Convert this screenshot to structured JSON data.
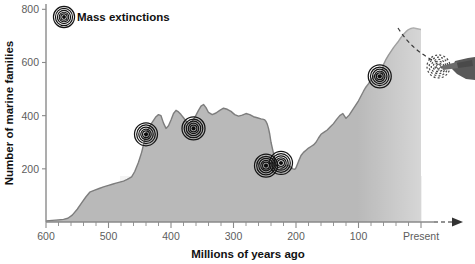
{
  "chart_data": {
    "type": "area",
    "title": "",
    "xlabel": "Millions of years ago",
    "ylabel": "Number of marine families",
    "xlim": [
      600,
      0
    ],
    "ylim": [
      0,
      800
    ],
    "x_ticks": [
      600,
      500,
      400,
      300,
      200,
      100,
      0
    ],
    "x_tick_labels": [
      "600",
      "500",
      "400",
      "300",
      "200",
      "100",
      "Present"
    ],
    "x_minor_tick_step": 20,
    "y_ticks": [
      200,
      400,
      600,
      800
    ],
    "y_tick_labels": [
      "200",
      "400",
      "600",
      "800"
    ],
    "grid": false,
    "legend": {
      "position": "top-left",
      "entries": [
        {
          "label": "Mass extinctions",
          "marker": "concentric-rings-icon"
        }
      ]
    },
    "series": [
      {
        "name": "Number of marine families",
        "x": [
          600,
          590,
          580,
          572,
          565,
          558,
          550,
          543,
          536,
          530,
          522,
          515,
          508,
          500,
          494,
          488,
          482,
          476,
          470,
          463,
          458,
          452,
          447,
          443,
          440,
          436,
          432,
          428,
          424,
          420,
          416,
          412,
          408,
          404,
          400,
          396,
          392,
          388,
          384,
          380,
          376,
          372,
          368,
          364,
          360,
          356,
          352,
          348,
          344,
          340,
          334,
          328,
          322,
          316,
          310,
          304,
          298,
          292,
          286,
          280,
          274,
          268,
          262,
          256,
          252,
          250,
          248,
          246,
          244,
          242,
          240,
          236,
          232,
          228,
          224,
          220,
          216,
          212,
          208,
          205,
          202,
          200,
          196,
          192,
          188,
          184,
          180,
          176,
          172,
          168,
          164,
          160,
          155,
          150,
          145,
          140,
          135,
          130,
          125,
          120,
          115,
          110,
          105,
          100,
          96,
          92,
          88,
          84,
          80,
          76,
          72,
          68,
          66,
          64,
          62,
          60,
          56,
          52,
          48,
          44,
          40,
          36,
          32,
          28,
          24,
          20,
          16,
          12,
          8,
          4,
          0
        ],
        "y": [
          4,
          6,
          8,
          10,
          14,
          26,
          48,
          72,
          95,
          112,
          120,
          126,
          132,
          138,
          142,
          146,
          150,
          154,
          160,
          170,
          190,
          225,
          262,
          300,
          330,
          352,
          368,
          382,
          396,
          404,
          400,
          372,
          352,
          362,
          384,
          408,
          420,
          414,
          404,
          392,
          380,
          370,
          374,
          386,
          402,
          420,
          436,
          442,
          430,
          412,
          404,
          410,
          420,
          428,
          424,
          416,
          404,
          398,
          402,
          408,
          404,
          396,
          392,
          388,
          386,
          384,
          378,
          368,
          352,
          330,
          300,
          258,
          215,
          196,
          198,
          204,
          212,
          214,
          206,
          200,
          198,
          204,
          228,
          250,
          262,
          270,
          278,
          284,
          290,
          300,
          316,
          330,
          338,
          346,
          358,
          370,
          386,
          400,
          408,
          390,
          402,
          420,
          438,
          456,
          474,
          492,
          508,
          520,
          534,
          548,
          556,
          552,
          548,
          556,
          572,
          592,
          612,
          628,
          642,
          656,
          668,
          680,
          694,
          706,
          716,
          724,
          728,
          730,
          728,
          726,
          724
        ]
      }
    ],
    "annotations": [
      {
        "name": "mass-extinction-1",
        "x": 440,
        "y": 330,
        "label": ""
      },
      {
        "name": "mass-extinction-2",
        "x": 364,
        "y": 352,
        "label": ""
      },
      {
        "name": "mass-extinction-3",
        "x": 248,
        "y": 212,
        "label": ""
      },
      {
        "name": "mass-extinction-4",
        "x": 224,
        "y": 222,
        "label": ""
      },
      {
        "name": "mass-extinction-5",
        "x": 66,
        "y": 548,
        "label": ""
      },
      {
        "name": "future-mass-extinction",
        "x": -28,
        "y": 585,
        "label": "",
        "style": "dashed"
      }
    ]
  },
  "legend": {
    "mass_extinctions_label": "Mass extinctions"
  },
  "axes": {
    "y_title": "Number of marine families",
    "x_title": "Millions of years ago"
  }
}
